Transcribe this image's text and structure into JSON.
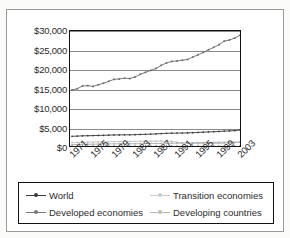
{
  "chart_data": {
    "type": "line",
    "title": "",
    "xlabel": "",
    "ylabel": "",
    "ylim": [
      0,
      30000
    ],
    "yticks": [
      0,
      5000,
      10000,
      15000,
      20000,
      25000,
      30000
    ],
    "ytick_labels": [
      "$0",
      "$5,000",
      "$10,000",
      "$15,000",
      "$20,000",
      "$25,000",
      "$30,000"
    ],
    "grid": true,
    "legend_position": "bottom",
    "x": [
      1971,
      1972,
      1973,
      1974,
      1975,
      1976,
      1977,
      1978,
      1979,
      1980,
      1981,
      1982,
      1983,
      1984,
      1985,
      1986,
      1987,
      1988,
      1989,
      1990,
      1991,
      1992,
      1993,
      1994,
      1995,
      1996,
      1997,
      1998,
      1999,
      2000,
      2001,
      2002,
      2003
    ],
    "xtick_labels": [
      "1971",
      "1975",
      "1979",
      "1983",
      "1987",
      "1991",
      "1995",
      "1999",
      "2003"
    ],
    "xticks": [
      1971,
      1975,
      1979,
      1983,
      1987,
      1991,
      1995,
      1999,
      2003
    ],
    "series": [
      {
        "name": "World",
        "color": "#3a3a3a",
        "marker": "dot",
        "values": [
          3000,
          3050,
          3120,
          3150,
          3180,
          3220,
          3260,
          3300,
          3340,
          3360,
          3380,
          3390,
          3420,
          3470,
          3510,
          3560,
          3620,
          3700,
          3760,
          3800,
          3820,
          3840,
          3870,
          3930,
          3990,
          4060,
          4130,
          4180,
          4240,
          4330,
          4380,
          4460,
          4620
        ]
      },
      {
        "name": "Developed economies",
        "color": "#6b6b6b",
        "marker": "square",
        "values": [
          14900,
          15200,
          15900,
          16000,
          15800,
          16200,
          16600,
          17100,
          17600,
          17700,
          17900,
          17800,
          18200,
          18900,
          19400,
          19900,
          20400,
          21200,
          21800,
          22200,
          22300,
          22500,
          22700,
          23300,
          23900,
          24500,
          25200,
          25800,
          26500,
          27400,
          27700,
          28200,
          28900
        ]
      },
      {
        "name": "Transition economies",
        "color": "#c2c2c2",
        "marker": "dot",
        "values": [
          1400,
          1430,
          1470,
          1500,
          1530,
          1560,
          1590,
          1620,
          1640,
          1650,
          1670,
          1680,
          1700,
          1720,
          1740,
          1750,
          1760,
          1770,
          1760,
          1700,
          1480,
          1300,
          1220,
          1150,
          1130,
          1140,
          1150,
          1130,
          1160,
          1230,
          1290,
          1350,
          1430
        ]
      },
      {
        "name": "Developing countries",
        "color": "#aeaeae",
        "marker": "dot",
        "values": [
          880,
          900,
          930,
          960,
          980,
          1000,
          1020,
          1040,
          1060,
          1070,
          1080,
          1080,
          1090,
          1110,
          1130,
          1140,
          1160,
          1190,
          1210,
          1230,
          1250,
          1270,
          1290,
          1320,
          1360,
          1400,
          1430,
          1420,
          1440,
          1480,
          1500,
          1530,
          1590
        ]
      }
    ]
  },
  "axis": {
    "ytick_labels": [
      "$30,000",
      "$25,000",
      "$20,000",
      "$15,000",
      "$10,000",
      "$5,000",
      "$0"
    ],
    "xtick_labels": [
      "1971",
      "1975",
      "1979",
      "1983",
      "1987",
      "1991",
      "1995",
      "1999",
      "2003"
    ]
  },
  "legend": {
    "items": [
      {
        "label": "World",
        "color": "#3a3a3a"
      },
      {
        "label": "Transition economies",
        "color": "#c9c9c9"
      },
      {
        "label": "Developed economies",
        "color": "#7a7a7a"
      },
      {
        "label": "Developing countries",
        "color": "#bcbcbc"
      }
    ]
  }
}
